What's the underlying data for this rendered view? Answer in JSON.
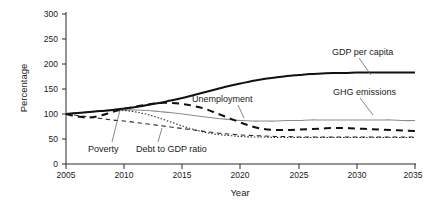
{
  "chart_data": {
    "type": "line",
    "title": "",
    "xlabel": "Year",
    "ylabel": "Percentage",
    "xlim": [
      2005,
      2035
    ],
    "ylim": [
      0,
      300
    ],
    "xticks": [
      2005,
      2010,
      2015,
      2020,
      2025,
      2030,
      2035
    ],
    "yticks": [
      0,
      50,
      100,
      150,
      200,
      250,
      300
    ],
    "xtick_labels": [
      "2005",
      "2010",
      "2015",
      "2020",
      "2025",
      "2030",
      "2035"
    ],
    "ytick_labels": [
      "0",
      "50",
      "100",
      "150",
      "200",
      "250",
      "300"
    ],
    "grid": false,
    "legend_position": "inline-annotations",
    "x": [
      2005,
      2006,
      2007,
      2008,
      2009,
      2010,
      2011,
      2012,
      2013,
      2014,
      2015,
      2016,
      2017,
      2018,
      2019,
      2020,
      2021,
      2022,
      2023,
      2024,
      2025,
      2026,
      2027,
      2028,
      2029,
      2030,
      2031,
      2032,
      2033,
      2034,
      2035
    ],
    "series": [
      {
        "name": "GDP per capita",
        "style": "solid",
        "color": "#111111",
        "width": "thick",
        "values": [
          100,
          102,
          104,
          106,
          108,
          111,
          114,
          118,
          122,
          127,
          132,
          138,
          144,
          150,
          156,
          161,
          166,
          170,
          173,
          176,
          178,
          180,
          181,
          182,
          182,
          183,
          183,
          183,
          183,
          183,
          183
        ]
      },
      {
        "name": "Unemployment",
        "style": "dashed",
        "color": "#111111",
        "width": "thick",
        "values": [
          100,
          95,
          93,
          97,
          104,
          110,
          115,
          119,
          122,
          122,
          120,
          116,
          110,
          101,
          92,
          83,
          75,
          70,
          68,
          68,
          69,
          70,
          71,
          72,
          72,
          71,
          70,
          69,
          68,
          67,
          66
        ]
      },
      {
        "name": "GHG emissions",
        "style": "solid",
        "color": "#8c8c8c",
        "width": "thin",
        "values": [
          100,
          102,
          104,
          106,
          107,
          108,
          108,
          107,
          105,
          103,
          100,
          97,
          94,
          91,
          89,
          87,
          86,
          86,
          86,
          87,
          87,
          88,
          88,
          88,
          88,
          88,
          88,
          88,
          88,
          87,
          87
        ]
      },
      {
        "name": "Debt to GDP ratio",
        "style": "dotted",
        "color": "#2b2b2b",
        "width": "thin",
        "values": [
          100,
          102,
          104,
          106,
          107,
          107,
          104,
          99,
          92,
          84,
          76,
          69,
          63,
          59,
          57,
          55,
          54,
          54,
          53,
          53,
          53,
          53,
          53,
          53,
          53,
          53,
          53,
          53,
          53,
          53,
          53
        ]
      },
      {
        "name": "Poverty",
        "style": "dashed-thin",
        "color": "#2b2b2b",
        "width": "thin",
        "values": [
          100,
          97,
          94,
          91,
          88,
          86,
          83,
          80,
          77,
          74,
          71,
          68,
          65,
          62,
          60,
          58,
          57,
          56,
          55,
          55,
          54,
          54,
          54,
          54,
          54,
          54,
          54,
          54,
          54,
          54,
          54
        ]
      }
    ],
    "annotations": [
      {
        "text": "GDP per capita",
        "attaches_to": "GDP per capita"
      },
      {
        "text": "GHG emissions",
        "attaches_to": "GHG emissions"
      },
      {
        "text": "Unemployment",
        "attaches_to": "Unemployment"
      },
      {
        "text": "Poverty",
        "attaches_to": "Poverty"
      },
      {
        "text": "Debt to GDP ratio",
        "attaches_to": "Debt to GDP ratio"
      }
    ]
  },
  "axes": {
    "y_title": "Percentage",
    "x_title": "Year",
    "y_ticks": [
      "300",
      "250",
      "200",
      "150",
      "100",
      "50",
      "0"
    ],
    "x_ticks": [
      "2005",
      "2010",
      "2015",
      "2020",
      "2025",
      "2030",
      "2035"
    ]
  },
  "labels": {
    "gdp": "GDP per capita",
    "ghg": "GHG emissions",
    "unemployment": "Unemployment",
    "poverty": "Poverty",
    "debt": "Debt to GDP ratio"
  },
  "colors": {
    "gdp": "#111111",
    "unemployment": "#111111",
    "ghg": "#8c8c8c",
    "debt": "#2b2b2b",
    "poverty": "#2b2b2b",
    "axis": "#2b2b2b",
    "background": "#ffffff"
  }
}
